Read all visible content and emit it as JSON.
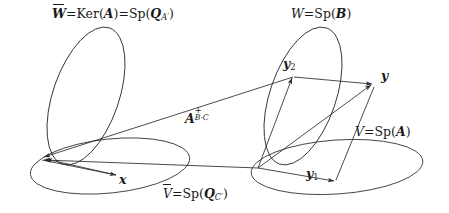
{
  "figure": {
    "kind": "vector-space-diagram",
    "background": "#ffffff",
    "stroke": "#2b2b2b",
    "text_color": "#1a1a1a"
  },
  "labels": {
    "w_bar": {
      "lhs": "W",
      "overbar": true,
      "eq1": "=",
      "ker": "Ker(",
      "ker_arg": "A",
      "ker_close": ")",
      "eq2": "=",
      "sp": "Sp(",
      "sp_arg": "Q",
      "sp_sub": "A′",
      "sp_close": ")"
    },
    "w": {
      "lhs": "W",
      "eq": "=",
      "sp": "Sp(",
      "sp_arg": "B",
      "sp_close": ")"
    },
    "v_bar": {
      "lhs": "V",
      "overbar": true,
      "eq": "=",
      "sp": "Sp(",
      "sp_arg": "Q",
      "sp_sub": "C′",
      "sp_close": ")"
    },
    "v": {
      "lhs": "V",
      "eq": "=",
      "sp": "Sp(",
      "sp_arg": "A",
      "sp_close": ")"
    },
    "map": {
      "base": "A",
      "sup": "+",
      "sub": "B·C"
    },
    "x": {
      "text": "x"
    },
    "y": {
      "text": "y"
    },
    "y1": {
      "base": "y",
      "sub": "1"
    },
    "y2": {
      "base": "y",
      "sub": "2"
    }
  },
  "geometry": {
    "left_origin": [
      42,
      158
    ],
    "right_origin": [
      258,
      168
    ],
    "y_point": [
      374,
      84
    ],
    "y1_point": [
      335,
      180
    ],
    "y2_point": [
      293,
      76
    ],
    "x_point": [
      117,
      176
    ]
  }
}
